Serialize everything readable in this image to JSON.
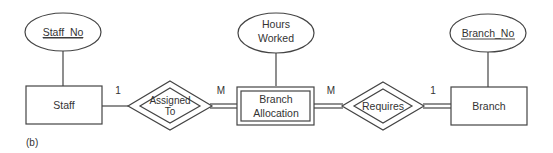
{
  "figure_label": "(b)",
  "entities": [
    {
      "id": "staff",
      "label": "Staff",
      "weak": false
    },
    {
      "id": "branch_allocation",
      "label_lines": [
        "Branch",
        "Allocation"
      ],
      "weak": true
    },
    {
      "id": "branch",
      "label": "Branch",
      "weak": false
    }
  ],
  "attributes": [
    {
      "id": "staff_no",
      "label": "Staff_No",
      "key": true,
      "entity": "staff"
    },
    {
      "id": "hours_worked",
      "label_lines": [
        "Hours",
        "Worked"
      ],
      "key": false,
      "entity": "branch_allocation"
    },
    {
      "id": "branch_no",
      "label": "Branch_No",
      "key": true,
      "entity": "branch"
    }
  ],
  "relationships": [
    {
      "id": "assigned_to",
      "label_lines": [
        "Assigned",
        "To"
      ],
      "identifying": true,
      "left_card": "1",
      "right_card": "M"
    },
    {
      "id": "requires",
      "label": "Requires",
      "identifying": true,
      "left_card": "M",
      "right_card": "1"
    }
  ],
  "colors": {
    "stroke": "#444444",
    "text": "#333333",
    "background": "#ffffff"
  }
}
